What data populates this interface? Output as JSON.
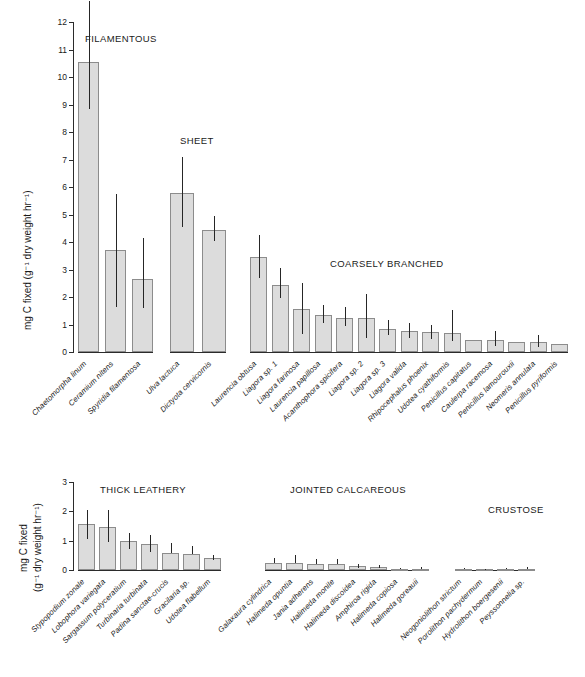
{
  "figure": {
    "ylabel_top": "mg C fixed (g⁻¹ dry weight hr⁻¹)",
    "ylabel_bottom_line1": "mg C fixed",
    "ylabel_bottom_line2": "(g⁻¹ dry weight hr⁻¹)",
    "bar_fill": "#dcdcdc",
    "bar_stroke": "#8c8c8c",
    "error_color": "#262626"
  },
  "chart_data": {
    "type": "bar",
    "title": "",
    "xlabel": "",
    "ylabel": "mg C fixed (g⁻¹ dry weight hr⁻¹)",
    "grid": false,
    "legend": "none",
    "panels": [
      {
        "name": "top",
        "ylim": [
          0,
          12
        ],
        "yticks": [
          0,
          1,
          2,
          3,
          4,
          5,
          6,
          7,
          8,
          9,
          10,
          11,
          12
        ],
        "ytick_labels": [
          "0",
          "1",
          "2",
          "3",
          "4",
          "5",
          "6",
          "7",
          "8",
          "9",
          "10",
          "11",
          "12"
        ],
        "groups": [
          {
            "label": "FILAMENTOUS",
            "categories": [
              "Chaetomorpha linum",
              "Ceramium nitens",
              "Spyridia filamentosa"
            ],
            "values": [
              10.55,
              3.7,
              2.65
            ],
            "err_low": [
              8.85,
              1.65,
              1.6
            ],
            "err_high": [
              12.75,
              5.75,
              4.15
            ]
          },
          {
            "label": "SHEET",
            "categories": [
              "Ulva lactuca",
              "Dictyota cervicornis"
            ],
            "values": [
              5.8,
              4.45
            ],
            "err_low": [
              4.55,
              4.05
            ],
            "err_high": [
              7.1,
              4.95
            ]
          },
          {
            "label": "COARSELY BRANCHED",
            "categories": [
              "Laurencia obtusa",
              "Liagora sp. 1",
              "Liagora farinosa",
              "Laurencia papillosa",
              "Acanthophora spicifera",
              "Liagora sp. 2",
              "Liagora sp. 3",
              "Liagora valida",
              "Rhipocephalus phoenix",
              "Udotea cyathiformis",
              "Penicillus capitatus",
              "Caulerpa racemosa",
              "Penicillus lamourouxii",
              "Neomeris annulata",
              "Penicillus pyriformis"
            ],
            "values": [
              3.45,
              2.45,
              1.55,
              1.35,
              1.25,
              1.25,
              0.85,
              0.75,
              0.72,
              0.68,
              0.45,
              0.45,
              0.38,
              0.35,
              0.3
            ],
            "err_low": [
              2.7,
              1.95,
              0.65,
              1.05,
              0.95,
              0.52,
              0.6,
              0.5,
              0.48,
              0.4,
              0.45,
              0.22,
              0.38,
              0.18,
              0.3
            ],
            "err_high": [
              4.25,
              3.05,
              2.5,
              1.72,
              1.62,
              2.1,
              1.18,
              1.05,
              0.98,
              1.52,
              0.45,
              0.78,
              0.38,
              0.62,
              0.3
            ]
          }
        ]
      },
      {
        "name": "bottom",
        "ylim": [
          0,
          3
        ],
        "yticks": [
          0,
          1,
          2,
          3
        ],
        "ytick_labels": [
          "0",
          "1",
          "2",
          "3"
        ],
        "groups": [
          {
            "label": "THICK LEATHERY",
            "categories": [
              "Stypopodium zonale",
              "Lobophora variegata",
              "Sargassum polyceratium",
              "Turbinaria turbinata",
              "Padina sanctae-crucis",
              "Gracilaria sp.",
              "Udotea flabellum"
            ],
            "values": [
              1.57,
              1.48,
              0.98,
              0.9,
              0.58,
              0.56,
              0.42
            ],
            "err_low": [
              1.05,
              0.95,
              0.72,
              0.62,
              0.58,
              0.56,
              0.35
            ],
            "err_high": [
              2.05,
              2.05,
              1.25,
              1.18,
              0.92,
              0.82,
              0.52
            ]
          },
          {
            "label": "JOINTED CALCAREOUS",
            "categories": [
              "Galaxaura cylindrica",
              "Halimeda opuntia",
              "Jania adherens",
              "Halimeda monile",
              "Halimeda discoidea",
              "Amphiroa rigida",
              "Halimeda copiosa",
              "Halimeda goreauii"
            ],
            "values": [
              0.23,
              0.24,
              0.2,
              0.19,
              0.12,
              0.11,
              0.04,
              0.04
            ],
            "err_low": [
              0.23,
              0.24,
              0.2,
              0.19,
              0.06,
              0.07,
              0.04,
              0.04
            ],
            "err_high": [
              0.42,
              0.5,
              0.36,
              0.36,
              0.2,
              0.18,
              0.08,
              0.09
            ]
          },
          {
            "label": "CRUSTOSE",
            "categories": [
              "Neogoniolithon strictum",
              "Porolithon pachydermum",
              "Hydrolithon boergesenii",
              "Peyssonnelia sp."
            ],
            "values": [
              0.03,
              0.03,
              0.03,
              0.04
            ],
            "err_low": [
              0.03,
              0.03,
              0.03,
              0.04
            ],
            "err_high": [
              0.06,
              0.05,
              0.06,
              0.09
            ]
          }
        ]
      }
    ]
  }
}
